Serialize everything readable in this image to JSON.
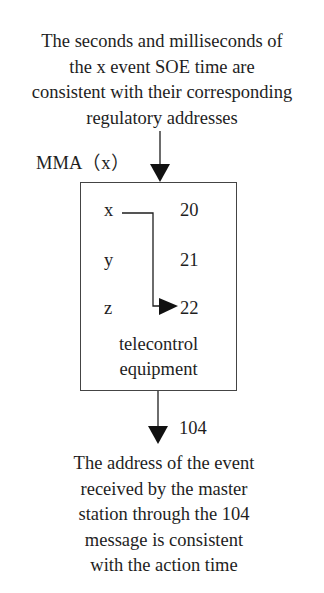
{
  "top_description": {
    "lines": [
      "The seconds and milliseconds of",
      "the x event SOE time are",
      "consistent with their corresponding",
      "regulatory addresses"
    ]
  },
  "input_label": "MMA（x）",
  "device": {
    "rows": [
      {
        "event": "x",
        "address": "20"
      },
      {
        "event": "y",
        "address": "21"
      },
      {
        "event": "z",
        "address": "22"
      }
    ],
    "label_lines": [
      "telecontrol",
      "equipment"
    ]
  },
  "output_label": "104",
  "bottom_description": {
    "lines": [
      "The address of the event",
      "received by the master",
      "station through the 104",
      "message is consistent",
      "with the action time"
    ]
  },
  "colors": {
    "line": "#1e1e1e",
    "box_border": "#444444",
    "background": "#ffffff"
  }
}
